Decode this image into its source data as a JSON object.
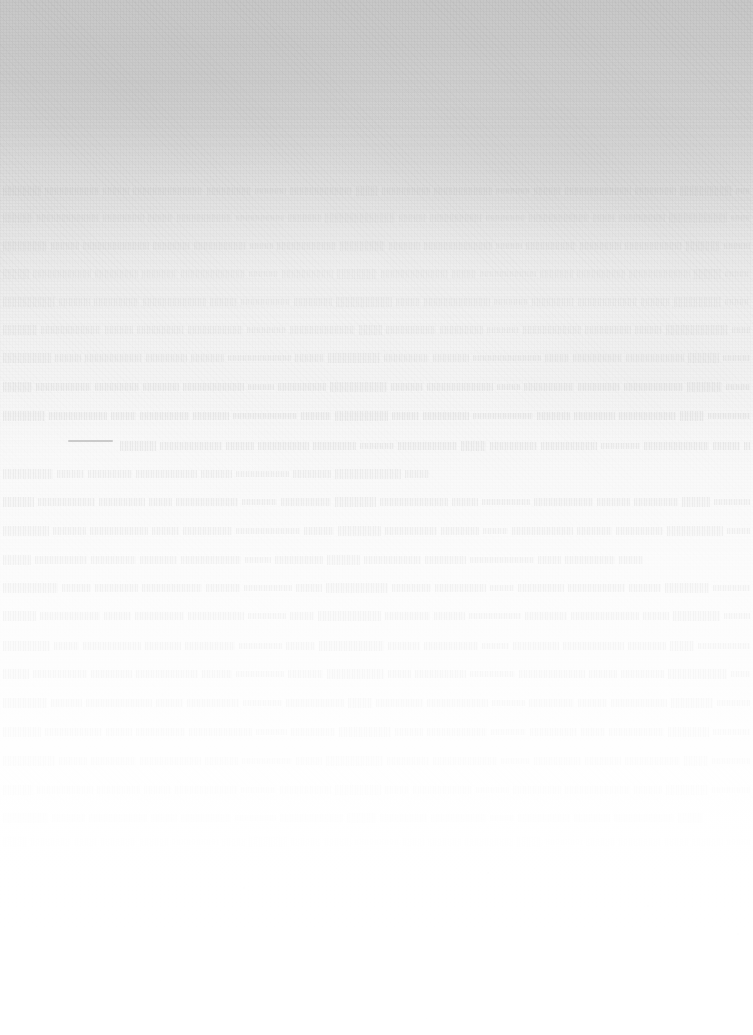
{
  "document": {
    "kind": "scanned-page",
    "legibility": "none",
    "legibility_note": "No characters are resolvable at any zoom level; the page is a severely bleached / over-exposed scan. No text content is transcribable.",
    "width": 753,
    "height": 1035,
    "text_content": "",
    "page_number": "",
    "heading": "",
    "body_text": ""
  },
  "colors": {
    "top_tone": "#c8c8c8",
    "upper_mid_tone": "#dadada",
    "mid_tone": "#eeeeee",
    "lower_tone": "#fafafa",
    "bottom_tone": "#ffffff",
    "ink_ghost": "#6e6e6e",
    "darkest_mark": "#9a9a9a"
  },
  "layout": {
    "text_left": 3,
    "text_right": 750,
    "line_pitch": 26,
    "first_ghost_line_y": 185,
    "last_ghost_line_y": 830,
    "bottom_margin_start_y": 850,
    "alignment": "justified",
    "left_margin": 0,
    "right_margin": 0
  },
  "marks": {
    "dark_dash": {
      "x": 68,
      "y": 440,
      "width": 45,
      "height": 2
    }
  },
  "ghost_lines": [
    {
      "y": 185,
      "x": 3,
      "width": 747,
      "opacity": 0.05,
      "words": [
        38,
        54,
        26,
        70,
        44,
        31,
        62,
        22,
        48,
        58,
        34,
        27,
        66,
        41,
        52,
        30,
        45,
        60,
        25,
        49,
        36,
        57,
        28,
        43
      ]
    },
    {
      "y": 212,
      "x": 3,
      "width": 747,
      "opacity": 0.045,
      "words": [
        30,
        62,
        41,
        25,
        55,
        48,
        33,
        70,
        27,
        52,
        39,
        60,
        22,
        46,
        58,
        31,
        43,
        66,
        29,
        50,
        37,
        54,
        26,
        44
      ]
    },
    {
      "y": 240,
      "x": 3,
      "width": 747,
      "opacity": 0.055,
      "words": [
        44,
        28,
        66,
        37,
        52,
        23,
        59,
        45,
        31,
        68,
        26,
        50,
        41,
        57,
        34,
        62,
        29,
        47,
        55,
        24,
        38,
        60,
        33,
        42
      ]
    },
    {
      "y": 268,
      "x": 3,
      "width": 747,
      "opacity": 0.048,
      "words": [
        26,
        58,
        43,
        35,
        64,
        29,
        51,
        40,
        67,
        24,
        56,
        33,
        48,
        61,
        27,
        45,
        53,
        30,
        69,
        36,
        42,
        58,
        25,
        39
      ]
    },
    {
      "y": 296,
      "x": 3,
      "width": 747,
      "opacity": 0.06,
      "words": [
        52,
        31,
        45,
        63,
        27,
        49,
        38,
        56,
        24,
        66,
        34,
        42,
        59,
        29,
        47,
        53,
        36,
        61,
        25,
        44,
        57,
        32,
        48,
        28
      ]
    },
    {
      "y": 324,
      "x": 3,
      "width": 747,
      "opacity": 0.07,
      "words": [
        34,
        60,
        28,
        47,
        55,
        39,
        65,
        23,
        50,
        43,
        32,
        58,
        46,
        27,
        62,
        35,
        41,
        54,
        30,
        67,
        25,
        48,
        37,
        56
      ]
    },
    {
      "y": 352,
      "x": 3,
      "width": 747,
      "opacity": 0.085,
      "words": [
        48,
        26,
        57,
        41,
        33,
        63,
        29,
        52,
        45,
        36,
        68,
        24,
        49,
        58,
        31,
        43,
        60,
        27,
        46,
        54,
        38,
        25,
        51,
        34
      ]
    },
    {
      "y": 381,
      "x": 3,
      "width": 747,
      "opacity": 0.11,
      "words": [
        29,
        55,
        44,
        36,
        61,
        26,
        48,
        57,
        32,
        66,
        23,
        50,
        42,
        59,
        35,
        45,
        28,
        63,
        39,
        52,
        27,
        47,
        56,
        31
      ]
    },
    {
      "y": 410,
      "x": 3,
      "width": 747,
      "opacity": 0.13,
      "words": [
        42,
        58,
        25,
        49,
        36,
        64,
        30,
        53,
        27,
        46,
        60,
        33,
        41,
        57,
        24,
        51,
        38,
        67,
        29,
        44,
        55,
        32,
        48,
        26
      ]
    },
    {
      "y": 440,
      "x": 120,
      "width": 630,
      "opacity": 0.145,
      "words": [
        36,
        62,
        28,
        51,
        43,
        34,
        59,
        25,
        47,
        56,
        39,
        65,
        27,
        48,
        33,
        60,
        30,
        45,
        54,
        23,
        49,
        37,
        58,
        26
      ]
    },
    {
      "y": 468,
      "x": 3,
      "width": 430,
      "opacity": 0.135,
      "words": [
        50,
        27,
        44,
        61,
        31,
        53,
        38,
        66,
        24,
        47,
        58,
        29,
        42,
        55,
        34
      ]
    },
    {
      "y": 496,
      "x": 3,
      "width": 747,
      "opacity": 0.155,
      "words": [
        31,
        57,
        46,
        23,
        62,
        35,
        50,
        41,
        68,
        26,
        48,
        59,
        33,
        44,
        28,
        54,
        37,
        63,
        25,
        51,
        42,
        30,
        56,
        45
      ]
    },
    {
      "y": 525,
      "x": 3,
      "width": 747,
      "opacity": 0.15,
      "words": [
        46,
        33,
        58,
        27,
        49,
        64,
        30,
        43,
        52,
        38,
        25,
        61,
        35,
        47,
        56,
        29,
        42,
        67,
        24,
        50,
        39,
        58,
        31,
        44
      ]
    },
    {
      "y": 554,
      "x": 3,
      "width": 640,
      "opacity": 0.145,
      "words": [
        28,
        52,
        45,
        37,
        60,
        26,
        48,
        33,
        57,
        41,
        64,
        23,
        50,
        36,
        59,
        27,
        46,
        54,
        31,
        43
      ]
    },
    {
      "y": 582,
      "x": 3,
      "width": 747,
      "opacity": 0.16,
      "words": [
        55,
        29,
        43,
        60,
        34,
        48,
        26,
        62,
        39,
        51,
        24,
        46,
        57,
        32,
        44,
        66,
        28,
        50,
        37,
        58,
        25,
        47,
        41,
        53
      ]
    },
    {
      "y": 610,
      "x": 3,
      "width": 747,
      "opacity": 0.15,
      "words": [
        33,
        60,
        27,
        49,
        56,
        38,
        24,
        63,
        45,
        31,
        52,
        42,
        68,
        26,
        47,
        35,
        58,
        29,
        44,
        61,
        30,
        48,
        55,
        36
      ]
    },
    {
      "y": 640,
      "x": 3,
      "width": 747,
      "opacity": 0.145,
      "words": [
        47,
        25,
        58,
        36,
        50,
        43,
        29,
        65,
        32,
        54,
        27,
        46,
        61,
        38,
        24,
        52,
        44,
        57,
        30,
        49,
        35,
        63,
        26,
        41
      ]
    },
    {
      "y": 668,
      "x": 3,
      "width": 747,
      "opacity": 0.14,
      "words": [
        26,
        54,
        41,
        62,
        30,
        48,
        35,
        57,
        23,
        51,
        45,
        66,
        28,
        43,
        59,
        32,
        47,
        25,
        60,
        38,
        52,
        29,
        44,
        56
      ]
    },
    {
      "y": 697,
      "x": 3,
      "width": 747,
      "opacity": 0.135,
      "words": [
        44,
        31,
        66,
        27,
        52,
        39,
        58,
        24,
        47,
        61,
        33,
        45,
        29,
        56,
        42,
        67,
        26,
        50,
        37,
        54,
        31,
        48,
        25,
        59
      ]
    },
    {
      "y": 726,
      "x": 3,
      "width": 747,
      "opacity": 0.125,
      "words": [
        38,
        57,
        26,
        49,
        63,
        31,
        44,
        52,
        28,
        60,
        35,
        47,
        24,
        55,
        41,
        66,
        30,
        46,
        58,
        27,
        43,
        51,
        34,
        62
      ]
    },
    {
      "y": 755,
      "x": 3,
      "width": 747,
      "opacity": 0.11,
      "words": [
        52,
        28,
        45,
        61,
        33,
        50,
        26,
        57,
        42,
        64,
        29,
        47,
        36,
        55,
        24,
        49,
        60,
        31,
        44,
        53,
        27,
        46,
        38,
        58
      ]
    },
    {
      "y": 784,
      "x": 3,
      "width": 747,
      "opacity": 0.095,
      "words": [
        30,
        56,
        43,
        27,
        62,
        35,
        51,
        46,
        24,
        59,
        33,
        48,
        65,
        28,
        42,
        54,
        31,
        47,
        26,
        60,
        39,
        52,
        25,
        44
      ]
    },
    {
      "y": 812,
      "x": 3,
      "width": 700,
      "opacity": 0.06,
      "words": [
        45,
        33,
        58,
        26,
        50,
        41,
        63,
        29,
        47,
        55,
        24,
        52,
        36,
        60,
        28,
        43,
        57,
        31,
        48,
        26,
        54
      ]
    },
    {
      "y": 836,
      "x": 3,
      "width": 747,
      "opacity": 0.03,
      "words": [
        24,
        40,
        22,
        35,
        28,
        46,
        23,
        38,
        30,
        26,
        44,
        21,
        33,
        48,
        25,
        36,
        29,
        42,
        23,
        31,
        27,
        45,
        22,
        39
      ]
    }
  ],
  "specks": [
    {
      "x": 243,
      "y": 887,
      "size": 2
    },
    {
      "x": 487,
      "y": 872,
      "size": 2
    },
    {
      "x": 647,
      "y": 905,
      "size": 2
    },
    {
      "x": 737,
      "y": 933,
      "size": 2
    },
    {
      "x": 160,
      "y": 980,
      "size": 2
    },
    {
      "x": 425,
      "y": 1018,
      "size": 2
    },
    {
      "x": 690,
      "y": 968,
      "size": 2
    },
    {
      "x": 336,
      "y": 1010,
      "size": 2
    },
    {
      "x": 511,
      "y": 1063,
      "size": 2
    }
  ]
}
